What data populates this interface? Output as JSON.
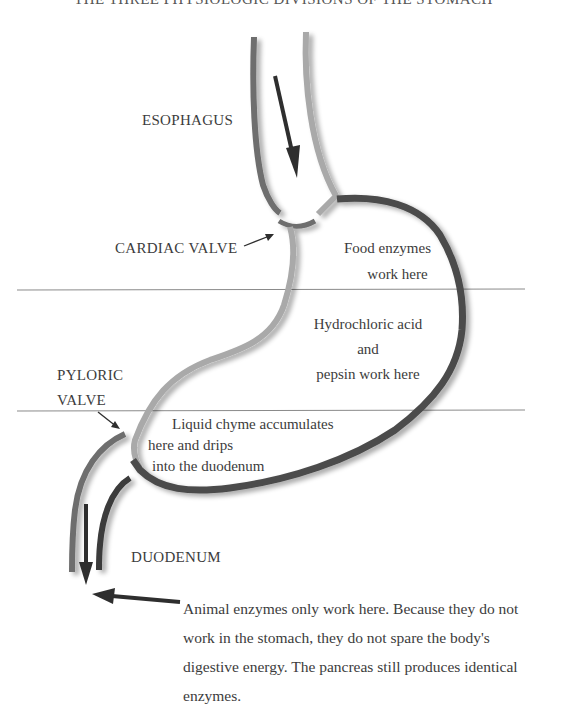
{
  "title": "THE THREE PHYSIOLOGIC DIVISIONS OF THE STOMACH",
  "labels": {
    "esophagus": "ESOPHAGUS",
    "cardiac_valve": "CARDIAC VALVE",
    "pyloric_valve_line1": "PYLORIC",
    "pyloric_valve_line2": "VALVE",
    "duodenum": "DUODENUM"
  },
  "zones": {
    "upper": {
      "line1": "Food enzymes",
      "line2": "work here"
    },
    "middle": {
      "line1": "Hydrochloric acid",
      "line2": "and",
      "line3": "pepsin work here"
    },
    "lower": {
      "line1": "Liquid chyme accumulates",
      "line2": "here and drips",
      "line3": "into the duodenum"
    }
  },
  "note": {
    "lines": [
      "Animal enzymes only work here. Because they do not",
      "work in the stomach, they do not spare the body's",
      "digestive energy. The pancreas still produces identical",
      "enzymes."
    ]
  },
  "colors": {
    "wall_mid": "#6e6e6e",
    "wall_light": "#a9a9a9",
    "wall_dark": "#4b4b4b",
    "arrow": "#2e2e2e",
    "divider": "#8a8a8a"
  }
}
